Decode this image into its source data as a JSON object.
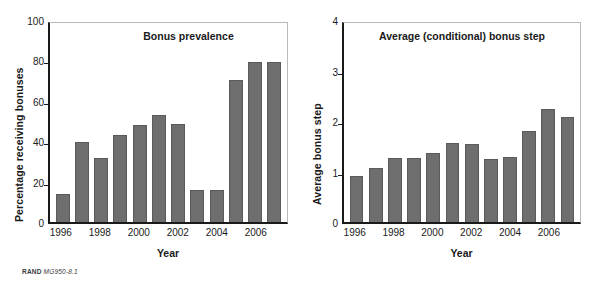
{
  "source_note": {
    "org": "RAND",
    "figure_number": "MG950-8.1"
  },
  "chart_data": [
    {
      "type": "bar",
      "title": "Bonus prevalence",
      "xlabel": "Year",
      "ylabel": "Percentage receiving bonuses",
      "ylim": [
        0,
        100
      ],
      "yticks": [
        0,
        20,
        40,
        60,
        80,
        100
      ],
      "yticklabels": [
        "0",
        "20",
        "40",
        "60",
        "80",
        "100"
      ],
      "grid": false,
      "legend": "none",
      "bar_color": "#6e6e6e",
      "categories": [
        "1996",
        "1997",
        "1998",
        "1999",
        "2000",
        "2001",
        "2002",
        "2003",
        "2004",
        "2005",
        "2006",
        "2007"
      ],
      "xticklabels": [
        "1996",
        "1998",
        "2000",
        "2002",
        "2004",
        "2006"
      ],
      "values": [
        14,
        39.5,
        31.5,
        43,
        48,
        53,
        48.5,
        16,
        16,
        70.5,
        79,
        79
      ]
    },
    {
      "type": "bar",
      "title": "Average (conditional) bonus step",
      "xlabel": "Year",
      "ylabel": "Average bonus step",
      "ylim": [
        0,
        4
      ],
      "yticks": [
        0,
        1,
        2,
        3,
        4
      ],
      "yticklabels": [
        "0",
        "1",
        "2",
        "3",
        "4"
      ],
      "grid": false,
      "legend": "none",
      "bar_color": "#6e6e6e",
      "categories": [
        "1996",
        "1997",
        "1998",
        "1999",
        "2000",
        "2001",
        "2002",
        "2003",
        "2004",
        "2005",
        "2006",
        "2007"
      ],
      "xticklabels": [
        "1996",
        "1998",
        "2000",
        "2002",
        "2004",
        "2006"
      ],
      "values": [
        0.92,
        1.07,
        1.26,
        1.26,
        1.37,
        1.56,
        1.54,
        1.25,
        1.29,
        1.8,
        2.23,
        2.08
      ]
    }
  ]
}
